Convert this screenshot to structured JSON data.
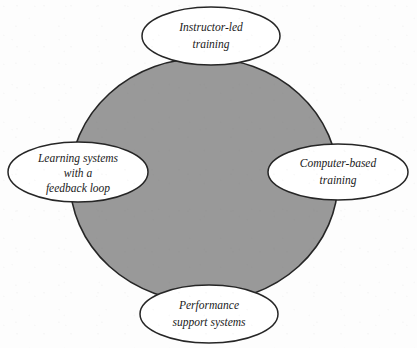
{
  "diagram": {
    "title": "",
    "background_color": "#fdfdfd",
    "center": {
      "name": "central-gray-circle",
      "fill_color": "#999999",
      "stroke_color": "#262626",
      "label": ""
    },
    "nodes": [
      {
        "id": "instructor-led-training",
        "position": "top",
        "lines": [
          "Instructor-led",
          "training"
        ],
        "line1": "Instructor-led",
        "line2": "training",
        "line3": "",
        "fill_color": "#ffffff",
        "stroke_color": "#262626"
      },
      {
        "id": "computer-based-training",
        "position": "right",
        "lines": [
          "Computer-based",
          "training"
        ],
        "line1": "Computer-based",
        "line2": "training",
        "line3": "",
        "fill_color": "#ffffff",
        "stroke_color": "#262626"
      },
      {
        "id": "performance-support-systems",
        "position": "bottom",
        "lines": [
          "Performance",
          "support systems"
        ],
        "line1": "Performance",
        "line2": "support systems",
        "line3": "",
        "fill_color": "#ffffff",
        "stroke_color": "#262626"
      },
      {
        "id": "learning-systems-with-a-feedback-loop",
        "position": "left",
        "lines": [
          "Learning systems",
          "with  a",
          "feedback loop"
        ],
        "line1": "Learning systems",
        "line2": "with  a",
        "line3": "feedback loop",
        "fill_color": "#ffffff",
        "stroke_color": "#262626"
      }
    ]
  }
}
